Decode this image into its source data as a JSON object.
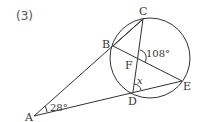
{
  "problem": {
    "number": "(3)"
  },
  "points": {
    "A": {
      "label": "A",
      "x": 34,
      "y": 116
    },
    "B": {
      "label": "B",
      "x": 113,
      "y": 46
    },
    "C": {
      "label": "C",
      "x": 143,
      "y": 19
    },
    "D": {
      "label": "D",
      "x": 133,
      "y": 92
    },
    "E": {
      "label": "E",
      "x": 182,
      "y": 81
    },
    "F": {
      "label": "F",
      "x": 138,
      "y": 58
    }
  },
  "circle": {
    "cx": 150,
    "cy": 58,
    "r": 40
  },
  "angles": {
    "A": "28°",
    "CFE": "108°",
    "x": "x"
  }
}
